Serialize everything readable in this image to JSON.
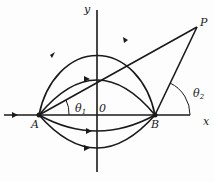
{
  "diagram": {
    "labels": {
      "y_axis": "y",
      "x_axis": "x",
      "point_a": "A",
      "point_b": "B",
      "point_p": "P",
      "origin": "0",
      "theta1": "θ",
      "theta1_sub": "1",
      "theta2": "θ",
      "theta2_sub": "2"
    },
    "colors": {
      "stroke": "#1a1a1a",
      "background": "#fdfdfd"
    }
  }
}
